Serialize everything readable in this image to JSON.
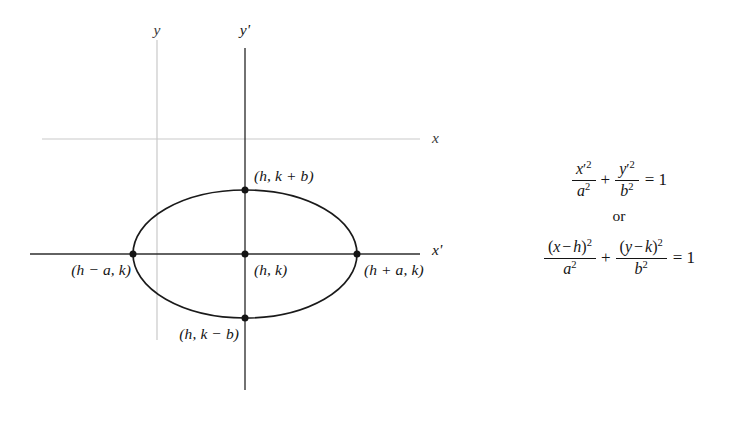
{
  "figure": {
    "title_alt": "Ellipse with translated axes",
    "colors": {
      "ink": "#141414",
      "faint_axis": "#c9c9c9",
      "curve": "#1a1a1a",
      "background": "#ffffff"
    },
    "axes": [
      {
        "name": "y",
        "label": "y",
        "style": "faint",
        "orientation": "vertical",
        "x": 157,
        "y1": 40,
        "y2": 340,
        "label_x": 157,
        "label_y": 30
      },
      {
        "name": "x",
        "label": "x",
        "style": "faint",
        "orientation": "horizontal",
        "y": 139,
        "x1": 42,
        "x2": 420,
        "label_x": 432,
        "label_y": 138
      },
      {
        "name": "y-prime",
        "label": "y'",
        "style": "primary",
        "orientation": "vertical",
        "x": 245,
        "y1": 48,
        "y2": 390,
        "label_x": 245,
        "label_y": 30
      },
      {
        "name": "x-prime",
        "label": "x'",
        "style": "primary",
        "orientation": "horizontal",
        "y": 254,
        "x1": 30,
        "x2": 420,
        "label_x": 432,
        "label_y": 250
      }
    ],
    "ellipse": {
      "center_x": 245,
      "center_y": 254,
      "radius_x": 112,
      "radius_y": 64,
      "stroke_width": 1.7
    },
    "points": [
      {
        "name": "top-vertex",
        "label": "(h, k + b)",
        "cx": 245,
        "cy": 190,
        "label_x": 254,
        "label_y": 176,
        "anchor": "left"
      },
      {
        "name": "left-vertex",
        "label": "(h − a, k)",
        "cx": 133,
        "cy": 254,
        "label_x": 131,
        "label_y": 270,
        "anchor": "right"
      },
      {
        "name": "center",
        "label": "(h, k)",
        "cx": 245,
        "cy": 254,
        "label_x": 254,
        "label_y": 270,
        "anchor": "left"
      },
      {
        "name": "right-vertex",
        "label": "(h + a, k)",
        "cx": 357,
        "cy": 254,
        "label_x": 364,
        "label_y": 270,
        "anchor": "left"
      },
      {
        "name": "bottom-vertex",
        "label": "(h, k − b)",
        "cx": 245,
        "cy": 318,
        "label_x": 239,
        "label_y": 334,
        "anchor": "right"
      }
    ]
  },
  "equations": {
    "connector": "or",
    "standard_form": {
      "plain": "x'2/a2 + y'2/b2 = 1",
      "term1": {
        "num_var": "x",
        "num_prime": "′",
        "num_exp": "2",
        "den_var": "a",
        "den_exp": "2"
      },
      "term2": {
        "num_var": "y",
        "num_prime": "′",
        "num_exp": "2",
        "den_var": "b",
        "den_exp": "2"
      },
      "operator": "+",
      "rhs": "= 1"
    },
    "translated_form": {
      "plain": "(x - h)2/a2 + (y - k)2/b2 = 1",
      "term1": {
        "num_open": "(",
        "num_var": "x",
        "num_minus": "−",
        "num_shift": "h",
        "num_close": ")",
        "num_exp": "2",
        "den_var": "a",
        "den_exp": "2"
      },
      "term2": {
        "num_open": "(",
        "num_var": "y",
        "num_minus": "−",
        "num_shift": "k",
        "num_close": ")",
        "num_exp": "2",
        "den_var": "b",
        "den_exp": "2"
      },
      "operator": "+",
      "rhs": "= 1"
    }
  }
}
